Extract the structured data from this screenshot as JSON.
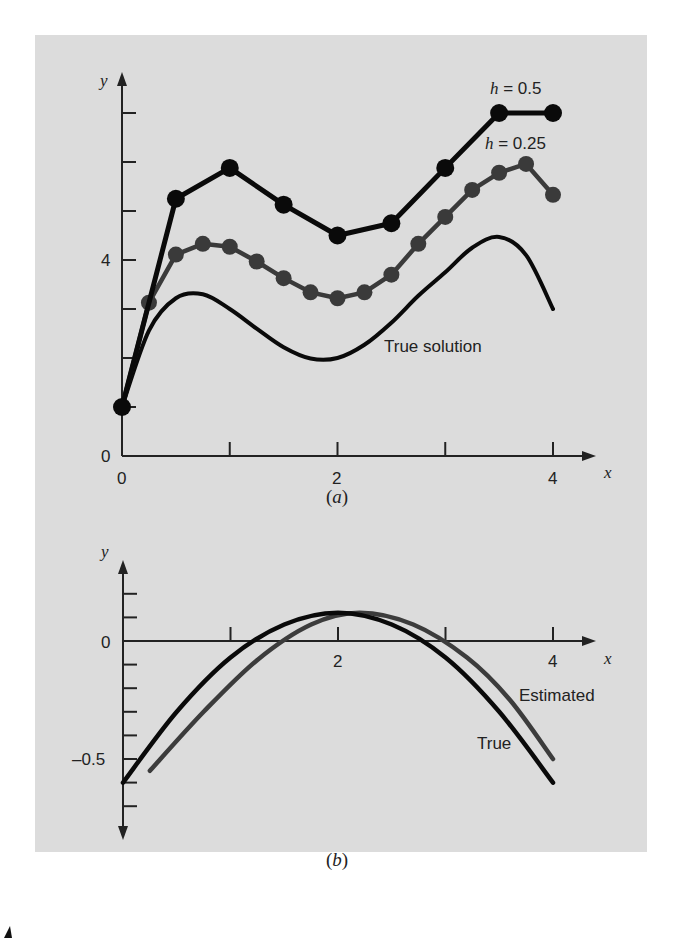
{
  "chart_data": [
    {
      "id": "a",
      "type": "line",
      "caption": "(a)",
      "xlabel": "x",
      "ylabel": "y",
      "xlim": [
        0,
        4.4
      ],
      "ylim": [
        0,
        7.5
      ],
      "x_ticks": [
        0,
        1,
        2,
        3,
        4
      ],
      "x_tick_labels": [
        "0",
        "",
        "2",
        "",
        "4"
      ],
      "y_ticks": [
        0,
        1,
        2,
        3,
        4,
        5,
        6,
        7
      ],
      "y_tick_labels": [
        "0",
        "",
        "",
        "",
        "4",
        "",
        "",
        ""
      ],
      "grid": false,
      "series": [
        {
          "name": "h = 0.5",
          "label_text": "h = 0.5",
          "style": "line-markers",
          "color": "#0a0a0a",
          "x": [
            0,
            0.5,
            1.0,
            1.5,
            2.0,
            2.5,
            3.0,
            3.5,
            4.0
          ],
          "values": [
            1.0,
            5.25,
            5.88,
            5.13,
            4.5,
            4.75,
            5.88,
            7.0,
            7.0
          ]
        },
        {
          "name": "h = 0.25",
          "label_text": "h = 0.25",
          "style": "line-markers",
          "color": "#3a3a3a",
          "x": [
            0,
            0.25,
            0.5,
            0.75,
            1.0,
            1.25,
            1.5,
            1.75,
            2.0,
            2.25,
            2.5,
            2.75,
            3.0,
            3.25,
            3.5,
            3.75,
            4.0
          ],
          "values": [
            1.0,
            3.13,
            4.11,
            4.33,
            4.27,
            3.97,
            3.63,
            3.34,
            3.22,
            3.34,
            3.7,
            4.33,
            4.88,
            5.43,
            5.78,
            5.96,
            5.33
          ]
        },
        {
          "name": "True solution",
          "label_text": "True solution",
          "style": "line",
          "color": "#0a0a0a",
          "x": [
            0,
            0.25,
            0.5,
            0.75,
            1.0,
            1.25,
            1.5,
            1.75,
            2.0,
            2.25,
            2.5,
            2.75,
            3.0,
            3.25,
            3.5,
            3.75,
            4.0
          ],
          "values": [
            1.0,
            2.56,
            3.22,
            3.3,
            3.0,
            2.6,
            2.22,
            1.99,
            2.0,
            2.27,
            2.72,
            3.27,
            3.75,
            4.25,
            4.47,
            4.1,
            3.0
          ]
        }
      ]
    },
    {
      "id": "b",
      "type": "line",
      "caption": "(b)",
      "xlabel": "x",
      "ylabel": "y",
      "xlim": [
        0,
        4.4
      ],
      "ylim": [
        -0.9,
        0.33
      ],
      "x_ticks": [
        1,
        2,
        3,
        4
      ],
      "x_tick_labels": [
        "",
        "2",
        "",
        "4"
      ],
      "y_ticks": [
        0.2,
        0.1,
        0,
        -0.1,
        -0.2,
        -0.3,
        -0.4,
        -0.5,
        -0.6,
        -0.7
      ],
      "y_tick_labels": [
        "",
        "",
        "0",
        "",
        "",
        "",
        "",
        "–0.5",
        "",
        ""
      ],
      "grid": false,
      "series": [
        {
          "name": "True",
          "label_text": "True",
          "style": "line",
          "color": "#0a0a0a",
          "x": [
            0,
            0.5,
            1.0,
            1.5,
            2.0,
            2.5,
            3.0,
            3.5,
            4.0
          ],
          "values": [
            -0.6,
            -0.3,
            -0.07,
            0.07,
            0.12,
            0.07,
            -0.07,
            -0.3,
            -0.6
          ]
        },
        {
          "name": "Estimated",
          "label_text": "Estimated",
          "style": "line",
          "color": "#3c3c3c",
          "x": [
            0.25,
            0.75,
            1.25,
            1.75,
            2.2,
            2.7,
            3.2,
            3.6,
            4.0
          ],
          "values": [
            -0.55,
            -0.3,
            -0.08,
            0.07,
            0.12,
            0.07,
            -0.07,
            -0.25,
            -0.5
          ]
        }
      ]
    }
  ],
  "labels": {
    "a": {
      "y_axis": "y",
      "x_axis": "x",
      "tick_x0": "0",
      "tick_x2": "2",
      "tick_x4": "4",
      "tick_y0": "0",
      "tick_y4": "4",
      "h05_italic": "h",
      "h05_rest": " = 0.5",
      "h025_italic": "h",
      "h025_rest": " = 0.25",
      "true_solution": "True solution",
      "caption_open": "(",
      "caption_letter": "a",
      "caption_close": ")"
    },
    "b": {
      "y_axis": "y",
      "x_axis": "x",
      "tick_x2": "2",
      "tick_x4": "4",
      "tick_y0": "0",
      "tick_y_neg05": "–0.5",
      "estimated": "Estimated",
      "true": "True",
      "caption_open": "(",
      "caption_letter": "b",
      "caption_close": ")"
    }
  },
  "colors": {
    "background": "#dcdcdc",
    "page": "#ffffff",
    "black_series": "#0a0a0a",
    "gray_series": "#3a3a3a"
  }
}
